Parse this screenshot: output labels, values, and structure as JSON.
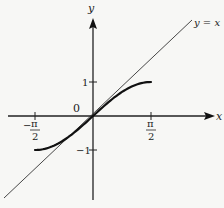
{
  "chart_data": {
    "type": "line",
    "title": "",
    "xlabel": "x",
    "ylabel": "y",
    "xlim": [
      -1.95,
      3.3
    ],
    "ylim": [
      -2.5,
      2.9
    ],
    "grid": false,
    "x_ticks": [
      {
        "value": -1.5708,
        "label_num": "π",
        "label_den": "2",
        "sign": "−"
      },
      {
        "value": 1.5708,
        "label_num": "π",
        "label_den": "2",
        "sign": ""
      }
    ],
    "y_ticks": [
      {
        "value": 1,
        "label": "1"
      },
      {
        "value": -1,
        "label": "−1"
      }
    ],
    "origin_label": "0",
    "series": [
      {
        "name": "y = sin x",
        "domain": [
          -1.5708,
          1.5708
        ],
        "x": [
          -1.5708,
          -1.2,
          -0.8,
          -0.4,
          0,
          0.4,
          0.8,
          1.2,
          1.5708
        ],
        "y": [
          -1,
          -0.932,
          -0.717,
          -0.389,
          0,
          0.389,
          0.717,
          0.932,
          1
        ],
        "style": "thick"
      },
      {
        "name": "y = x",
        "label": "y = x",
        "x": [
          -2.4,
          2.7
        ],
        "y": [
          -2.4,
          2.7
        ],
        "style": "thin"
      }
    ]
  },
  "labels": {
    "y_axis": "y",
    "x_axis": "x",
    "line_label": "y = x",
    "origin": "0",
    "tick_y_pos": "1",
    "tick_y_neg": "−1",
    "tick_x_neg_sign": "−",
    "tick_x_num": "π",
    "tick_x_den": "2"
  }
}
